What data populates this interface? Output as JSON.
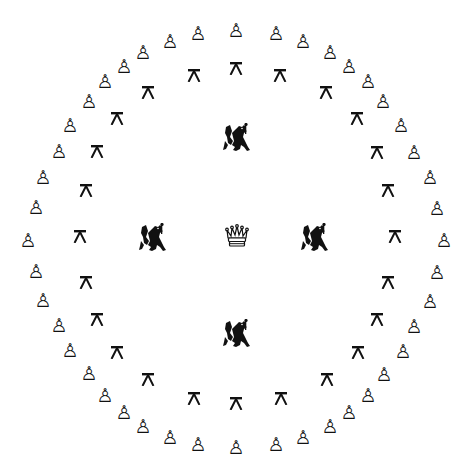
{
  "board": {
    "background": "#ffffff",
    "piece_color": "#111111",
    "center": [
      237,
      237
    ]
  },
  "pieces": {
    "queen": {
      "glyph": "crown-icon",
      "x": 237,
      "y": 236
    },
    "gryphons": [
      {
        "x": 236,
        "y": 138
      },
      {
        "x": 152,
        "y": 238
      },
      {
        "x": 314,
        "y": 238
      },
      {
        "x": 236,
        "y": 334
      }
    ],
    "stools": [
      {
        "x": 236,
        "y": 68
      },
      {
        "x": 280,
        "y": 75
      },
      {
        "x": 326,
        "y": 92
      },
      {
        "x": 357,
        "y": 118
      },
      {
        "x": 377,
        "y": 152
      },
      {
        "x": 388,
        "y": 190
      },
      {
        "x": 395,
        "y": 236
      },
      {
        "x": 388,
        "y": 282
      },
      {
        "x": 377,
        "y": 319
      },
      {
        "x": 358,
        "y": 352
      },
      {
        "x": 327,
        "y": 379
      },
      {
        "x": 281,
        "y": 398
      },
      {
        "x": 236,
        "y": 403
      },
      {
        "x": 194,
        "y": 398
      },
      {
        "x": 148,
        "y": 379
      },
      {
        "x": 117,
        "y": 352
      },
      {
        "x": 97,
        "y": 319
      },
      {
        "x": 86,
        "y": 282
      },
      {
        "x": 80,
        "y": 236
      },
      {
        "x": 86,
        "y": 190
      },
      {
        "x": 97,
        "y": 151
      },
      {
        "x": 117,
        "y": 118
      },
      {
        "x": 148,
        "y": 92
      },
      {
        "x": 194,
        "y": 75
      }
    ],
    "pawn_glyph": "♙",
    "pawns": [
      {
        "x": 236,
        "y": 30
      },
      {
        "x": 276,
        "y": 33
      },
      {
        "x": 303,
        "y": 41
      },
      {
        "x": 330,
        "y": 52
      },
      {
        "x": 349,
        "y": 66
      },
      {
        "x": 368,
        "y": 81
      },
      {
        "x": 383,
        "y": 101
      },
      {
        "x": 401,
        "y": 125
      },
      {
        "x": 414,
        "y": 152
      },
      {
        "x": 430,
        "y": 177
      },
      {
        "x": 437,
        "y": 208
      },
      {
        "x": 444,
        "y": 240
      },
      {
        "x": 437,
        "y": 272
      },
      {
        "x": 430,
        "y": 301
      },
      {
        "x": 414,
        "y": 326
      },
      {
        "x": 403,
        "y": 351
      },
      {
        "x": 384,
        "y": 374
      },
      {
        "x": 368,
        "y": 395
      },
      {
        "x": 349,
        "y": 412
      },
      {
        "x": 330,
        "y": 426
      },
      {
        "x": 303,
        "y": 437
      },
      {
        "x": 276,
        "y": 444
      },
      {
        "x": 236,
        "y": 447
      },
      {
        "x": 198,
        "y": 444
      },
      {
        "x": 170,
        "y": 437
      },
      {
        "x": 143,
        "y": 426
      },
      {
        "x": 124,
        "y": 412
      },
      {
        "x": 105,
        "y": 395
      },
      {
        "x": 89,
        "y": 373
      },
      {
        "x": 70,
        "y": 350
      },
      {
        "x": 59,
        "y": 325
      },
      {
        "x": 43,
        "y": 300
      },
      {
        "x": 36,
        "y": 271
      },
      {
        "x": 28,
        "y": 240
      },
      {
        "x": 36,
        "y": 207
      },
      {
        "x": 43,
        "y": 177
      },
      {
        "x": 59,
        "y": 151
      },
      {
        "x": 70,
        "y": 125
      },
      {
        "x": 89,
        "y": 101
      },
      {
        "x": 105,
        "y": 81
      },
      {
        "x": 124,
        "y": 66
      },
      {
        "x": 143,
        "y": 52
      },
      {
        "x": 170,
        "y": 41
      },
      {
        "x": 198,
        "y": 33
      }
    ]
  }
}
